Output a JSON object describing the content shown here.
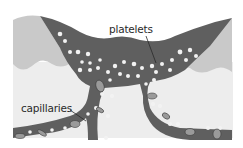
{
  "diagram": {
    "labels": {
      "platelets": "platelets",
      "capillaries": "capillaries"
    },
    "colors": {
      "background": "#ffffff",
      "tissue_light": "#ececec",
      "skin_layer": "#c8c8c8",
      "blood": "#5f5f5f",
      "cell_white": "#f4f4f4",
      "red_cell": "#9a9a9a",
      "text": "#2a2a2a"
    }
  }
}
